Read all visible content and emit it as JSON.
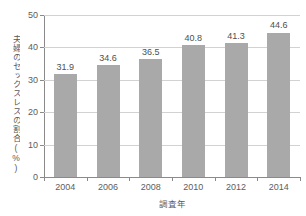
{
  "chart_data": {
    "type": "bar",
    "title": "",
    "categories": [
      "2004",
      "2006",
      "2008",
      "2010",
      "2012",
      "2014"
    ],
    "values": [
      31.9,
      34.6,
      36.5,
      40.8,
      41.3,
      44.6
    ],
    "value_labels": [
      "31.9",
      "34.6",
      "36.5",
      "40.8",
      "41.3",
      "44.6"
    ],
    "xlabel": "調査年",
    "ylabel": "夫婦のセックスレスの割合(%)",
    "ylim": [
      0,
      50
    ],
    "yticks": [
      0,
      10,
      20,
      30,
      40,
      50
    ],
    "ytick_labels": [
      "0",
      "10",
      "20",
      "30",
      "40",
      "50"
    ],
    "grid": true,
    "grid_axis": "y",
    "legend": false,
    "legend_position": "none",
    "bar_color": "#a9a9a9",
    "grid_color": "#d2d2d2",
    "axis_color": "#8a8a8a",
    "background_color": "#ffffff"
  }
}
